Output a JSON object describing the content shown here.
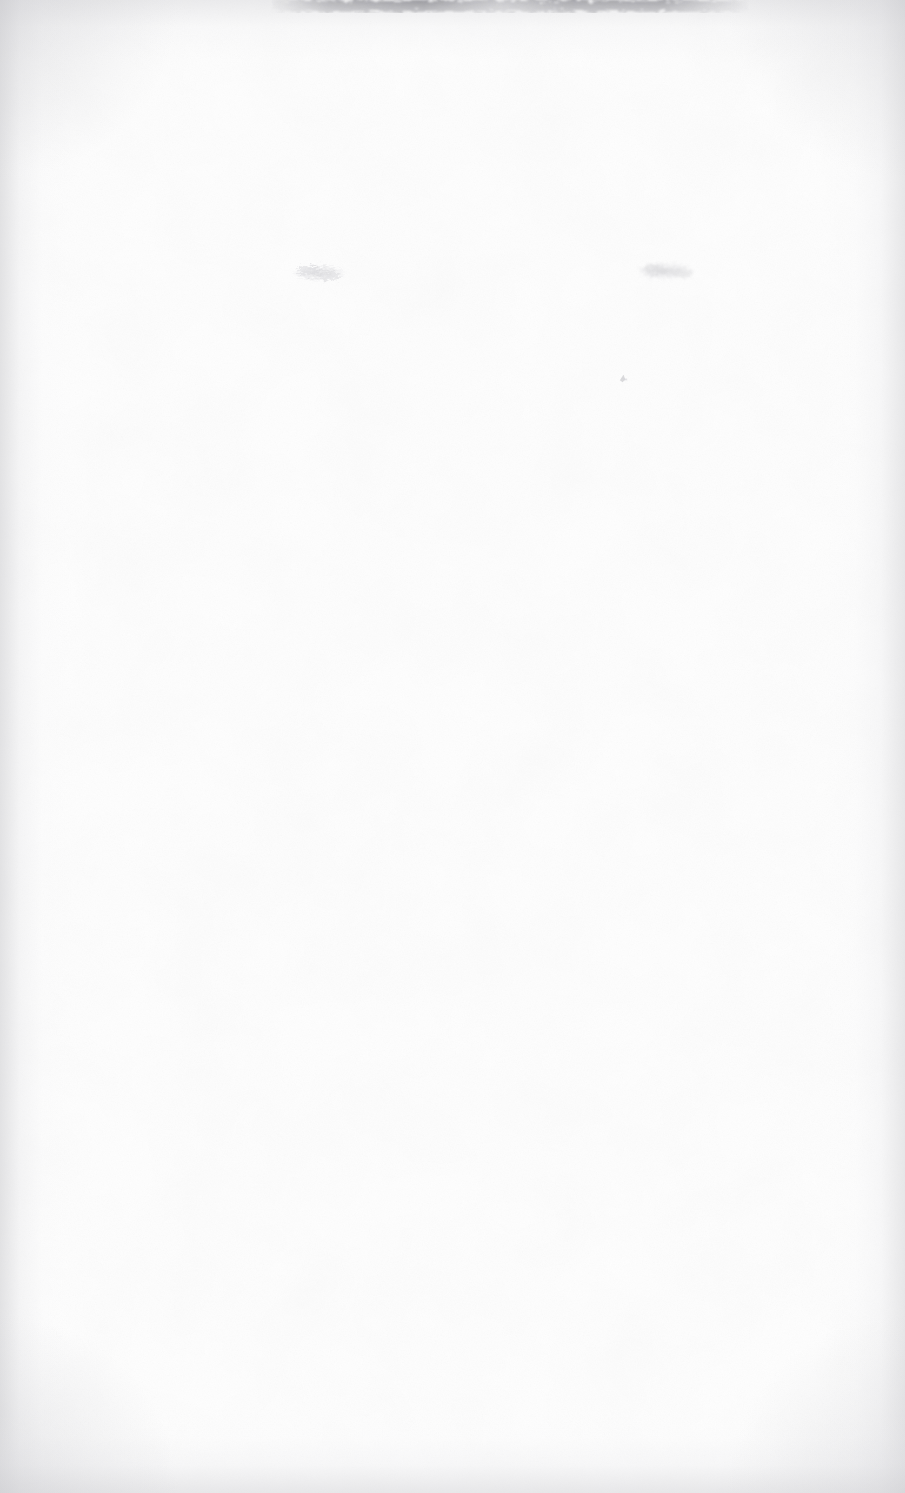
{
  "document": {
    "kind": "scanned-page",
    "page_state": "blank",
    "visible_text": "",
    "width_px": 905,
    "height_px": 1493,
    "background_color": "#fefefe",
    "paper_tone": "#ffffff"
  },
  "artifacts": {
    "top_edge_smear": {
      "name": "top-edge-smear",
      "description": "ragged gray scanner edge smear spanning the upper border",
      "x": 250,
      "y": 0,
      "width": 520,
      "height": 22,
      "color": "#9a9a9f"
    },
    "smudges": [
      {
        "name": "faint-smudge-left",
        "description": "faint illegible gray smudge, upper-left-of-center",
        "x": 288,
        "y": 258,
        "width": 62,
        "height": 32,
        "color": "#c9c9cf"
      },
      {
        "name": "faint-smudge-right",
        "description": "faint illegible gray smudge, upper-right-of-center",
        "x": 634,
        "y": 256,
        "width": 70,
        "height": 32,
        "color": "#cacad0"
      }
    ],
    "speck": {
      "name": "ink-speck",
      "description": "tiny isolated gray speck below the right smudge",
      "x": 618,
      "y": 373,
      "width": 11,
      "height": 12,
      "color": "#bdbdc3"
    },
    "edge_shading": {
      "left_band_color": "#cdcdd0",
      "right_band_color": "#d2d2d5",
      "bottom_band_color": "#d6d6d9",
      "top_band_color": "#ceced2"
    }
  }
}
